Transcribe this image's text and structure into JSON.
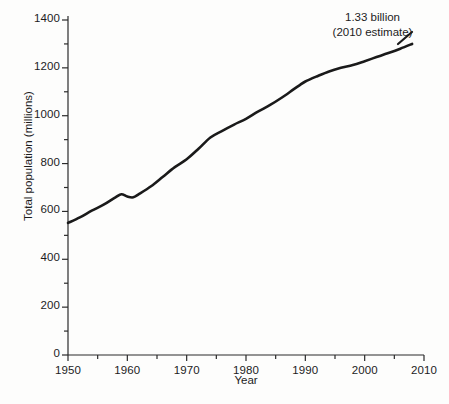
{
  "chart_data": {
    "type": "line",
    "title": "",
    "xlabel": "Year",
    "ylabel": "Total population (millions)",
    "xlim": [
      1950,
      2010
    ],
    "ylim": [
      0,
      1400
    ],
    "grid": false,
    "legend": null,
    "x_major_ticks": [
      1950,
      1960,
      1970,
      1980,
      1990,
      2000,
      2010
    ],
    "x_minor_step": 5,
    "y_major_ticks": [
      0,
      200,
      400,
      600,
      800,
      1000,
      1200,
      1400
    ],
    "y_minor_step": 100,
    "line_color": "#1a1a1a",
    "line_width": 2.6,
    "series": [
      {
        "name": "Total population (millions)",
        "x": [
          1950,
          1952,
          1954,
          1956,
          1958,
          1959,
          1960,
          1961,
          1962,
          1964,
          1966,
          1968,
          1970,
          1972,
          1974,
          1976,
          1978,
          1980,
          1982,
          1984,
          1986,
          1988,
          1989,
          1990,
          1992,
          1994,
          1996,
          1998,
          2000,
          2002,
          2004,
          2006,
          2008
        ],
        "y": [
          552,
          575,
          603,
          628,
          659,
          672,
          662,
          659,
          673,
          705,
          745,
          785,
          818,
          862,
          909,
          937,
          963,
          987,
          1017,
          1044,
          1075,
          1110,
          1127,
          1143,
          1165,
          1185,
          1200,
          1212,
          1228,
          1245,
          1262,
          1280,
          1300
        ]
      }
    ],
    "annotations": [
      {
        "line1": "1.33 billion",
        "line2": "(2010 estimate)"
      }
    ]
  },
  "axes": {
    "x_tick_labels": [
      "1950",
      "1960",
      "1970",
      "1980",
      "1990",
      "2000",
      "2010"
    ],
    "y_tick_labels": [
      "0",
      "200",
      "400",
      "600",
      "800",
      "1000",
      "1200",
      "1400"
    ],
    "x_axis_title": "Year",
    "y_axis_title": "Total population (millions)"
  },
  "annotation": {
    "value_text": "1.33 billion",
    "note_text": "(2010 estimate)"
  }
}
